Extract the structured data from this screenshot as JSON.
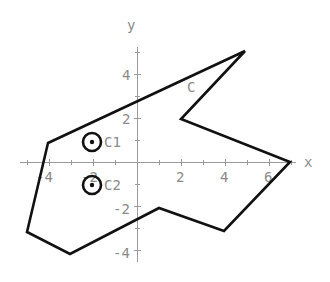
{
  "diagram": {
    "axes": {
      "x_label": "x",
      "y_label": "y",
      "x_ticks": [
        {
          "value": -4,
          "label": "-4"
        },
        {
          "value": -2,
          "label": "-2"
        },
        {
          "value": 2,
          "label": "2"
        },
        {
          "value": 4,
          "label": "4"
        },
        {
          "value": 6,
          "label": "6"
        }
      ],
      "y_ticks": [
        {
          "value": 4,
          "label": "4"
        },
        {
          "value": 2,
          "label": "2"
        },
        {
          "value": -2,
          "label": "-2"
        },
        {
          "value": -4,
          "label": "-4"
        }
      ],
      "color": "#9a9a9a"
    },
    "polygon": {
      "label": "C",
      "vertices": [
        [
          -4,
          1
        ],
        [
          -5,
          -3
        ],
        [
          -3,
          -4
        ],
        [
          1,
          -2
        ],
        [
          4,
          -3
        ],
        [
          7,
          0
        ],
        [
          2,
          2
        ],
        [
          5,
          5
        ]
      ],
      "stroke": "#111111"
    },
    "circles": [
      {
        "label": "C1",
        "center": [
          -2,
          1
        ],
        "radius": 0.4
      },
      {
        "label": "C2",
        "center": [
          -2,
          -1
        ],
        "radius": 0.4
      }
    ]
  }
}
